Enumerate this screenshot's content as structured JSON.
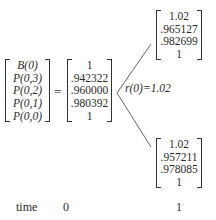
{
  "diagram": {
    "left_vector": {
      "labels": [
        "B(0)",
        "P(0,3)",
        "P(0,2)",
        "P(0,1)",
        "P(0,0)"
      ]
    },
    "equals": "=",
    "root_vector": {
      "values": [
        "1",
        ".942322",
        ".960000",
        ".980392",
        "1"
      ]
    },
    "rate_label": "r(0)=1.02",
    "up_node": {
      "values": [
        "1.02",
        ".965127",
        ".982699",
        "1"
      ]
    },
    "down_node": {
      "values": [
        "1.02",
        ".957211",
        ".978085",
        "1"
      ]
    },
    "timeline": {
      "label": "time",
      "t0": "0",
      "t1": "1"
    }
  }
}
